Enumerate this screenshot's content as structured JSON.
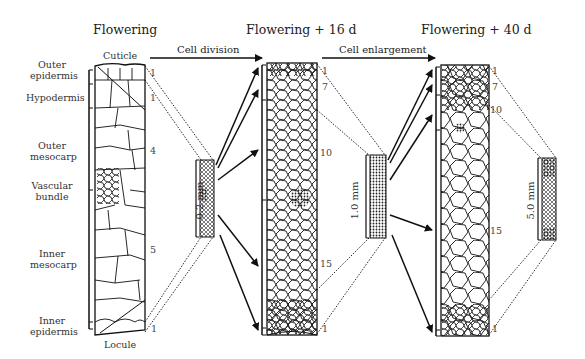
{
  "stages": [
    {
      "title": "Flowering",
      "scale": "0.2 mm",
      "layer_counts": [
        "1",
        "1",
        "4",
        "5",
        "1"
      ]
    },
    {
      "title": "Flowering + 16 d",
      "scale": "1.0 mm",
      "layer_counts": [
        "1",
        "7",
        "10",
        "15",
        "1"
      ]
    },
    {
      "title": "Flowering + 40 d",
      "scale": "5.0 mm",
      "layer_counts": [
        "1",
        "7",
        "10",
        "15",
        "1"
      ]
    }
  ],
  "processes": [
    {
      "label": "Cell division"
    },
    {
      "label": "Cell enlargement"
    }
  ],
  "tissue_labels": {
    "cuticle": "Cuticle",
    "outer_epidermis": [
      "Outer",
      "epidermis"
    ],
    "hypodermis": "Hypodermis",
    "outer_mesocarp": [
      "Outer",
      "mesocarp"
    ],
    "vascular_bundle": [
      "Vascular",
      "bundle"
    ],
    "inner_mesocarp": [
      "Inner",
      "mesocarp"
    ],
    "inner_epidermis": [
      "Inner",
      "epidermis"
    ],
    "locule": "Locule"
  },
  "colors": {
    "ink": "#111111",
    "background": "#ffffff"
  }
}
